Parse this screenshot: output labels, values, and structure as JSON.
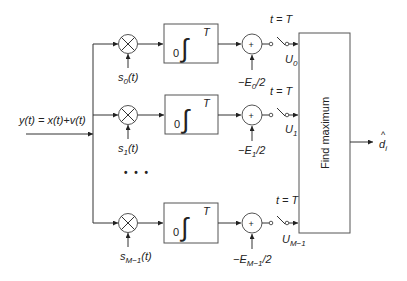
{
  "diagram": {
    "input": {
      "label": "y(t) = x(t)+v(t)"
    },
    "branches": [
      {
        "id": 0,
        "y": 44,
        "reference_signal": "s",
        "reference_sub": "0",
        "reference_suffix": "(t)",
        "integrator": {
          "lower": "0",
          "upper": "T",
          "symbol": "∫"
        },
        "bias_prefix": "−E",
        "bias_sub": "0",
        "bias_suffix": "/2",
        "sum_symbol": "+",
        "switch_label": "t = T",
        "output": "U",
        "output_sub": "0"
      },
      {
        "id": 1,
        "y": 115,
        "reference_signal": "s",
        "reference_sub": "1",
        "reference_suffix": "(t)",
        "integrator": {
          "lower": "0",
          "upper": "T",
          "symbol": "∫"
        },
        "bias_prefix": "−E",
        "bias_sub": "1",
        "bias_suffix": "/2",
        "sum_symbol": "+",
        "switch_label": "t = T",
        "output": "U",
        "output_sub": "1"
      },
      {
        "id": 2,
        "y": 223,
        "reference_signal": "s",
        "reference_sub": "M−1",
        "reference_suffix": "(t)",
        "integrator": {
          "lower": "0",
          "upper": "T",
          "symbol": "∫"
        },
        "bias_prefix": "−E",
        "bias_sub": "M−1",
        "bias_suffix": "/2",
        "sum_symbol": "+",
        "switch_label": "t = T",
        "output": "U",
        "output_sub": "M−1"
      }
    ],
    "ellipsis": "• • •",
    "decision_block": {
      "label": "Find maximum"
    },
    "output": {
      "hat": "^",
      "symbol": "d",
      "sub": "i"
    }
  }
}
